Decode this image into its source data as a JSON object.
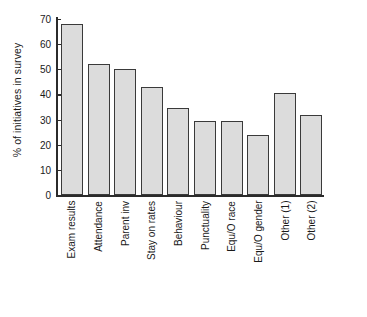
{
  "chart_data": {
    "type": "bar",
    "title": "",
    "xlabel": "",
    "ylabel": "% of initiatives in survey",
    "ylim": [
      0,
      70
    ],
    "yticks": [
      0,
      10,
      20,
      30,
      40,
      50,
      60,
      70
    ],
    "grid": false,
    "legend": null,
    "categories": [
      "Exam results",
      "Attendance",
      "Parent inv",
      "Stay on rates",
      "Behaviour",
      "Punctuality",
      "Equ/O race",
      "Equ/O gender",
      "Other (1)",
      "Other (2)"
    ],
    "values": [
      68,
      52,
      50,
      43,
      34.5,
      29.5,
      29.5,
      24,
      40.5,
      32
    ],
    "bar_fill_color": "#dcdcdc",
    "bar_edge_color": "#3a3a3a",
    "axis_color": "#2b2b2b",
    "background_color": "#ffffff"
  }
}
